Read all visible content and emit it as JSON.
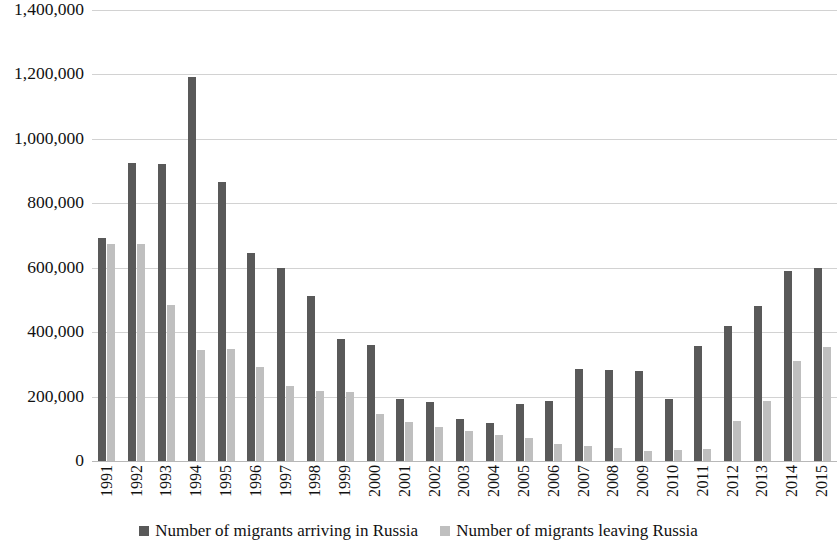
{
  "chart_data": {
    "type": "bar",
    "title": "",
    "subtitle": "",
    "xlabel": "",
    "ylabel": "",
    "ylim": [
      0,
      1400000
    ],
    "y_ticks": [
      0,
      200000,
      400000,
      600000,
      800000,
      1000000,
      1200000,
      1400000
    ],
    "y_tick_labels": [
      "0",
      "200,000",
      "400,000",
      "600,000",
      "800,000",
      "1,000,000",
      "1,200,000",
      "1,400,000"
    ],
    "grid": true,
    "legend_position": "bottom",
    "orientation": "vertical",
    "grouping": "clustered",
    "categories": [
      "1991",
      "1992",
      "1993",
      "1994",
      "1995",
      "1996",
      "1997",
      "1998",
      "1999",
      "2000",
      "2001",
      "2002",
      "2003",
      "2004",
      "2005",
      "2006",
      "2007",
      "2008",
      "2009",
      "2010",
      "2011",
      "2012",
      "2013",
      "2014",
      "2015"
    ],
    "series": [
      {
        "name": "Number of migrants arriving in Russia",
        "color": "#595959",
        "values": [
          692000,
          926000,
          923000,
          1191000,
          867000,
          647000,
          598000,
          513000,
          380000,
          360000,
          194000,
          184000,
          129000,
          119000,
          177000,
          186000,
          287000,
          282000,
          280000,
          192000,
          357000,
          418000,
          482000,
          590000,
          598000
        ]
      },
      {
        "name": "Number of migrants leaving Russia",
        "color": "#bfbfbf",
        "values": [
          675000,
          673000,
          483000,
          346000,
          347000,
          291000,
          233000,
          216000,
          215000,
          146000,
          121000,
          107000,
          94000,
          80000,
          70000,
          54000,
          47000,
          39000,
          32000,
          33000,
          37000,
          123000,
          186000,
          310000,
          353000
        ]
      }
    ]
  },
  "legend": {
    "items": [
      {
        "label": "Number of migrants arriving in Russia",
        "marker": "filled-square-dark"
      },
      {
        "label": "Number of migrants leaving Russia",
        "marker": "filled-square-light"
      }
    ]
  }
}
